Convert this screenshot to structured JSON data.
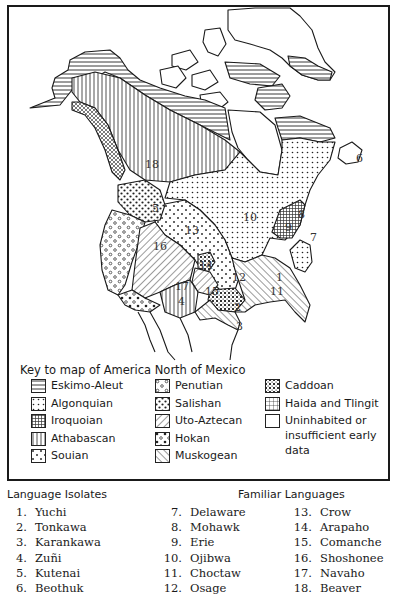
{
  "map": {
    "region_labels": [
      {
        "id": "18",
        "x": 145,
        "y": 168
      },
      {
        "id": "6",
        "x": 356,
        "y": 162
      },
      {
        "id": "5",
        "x": 152,
        "y": 212
      },
      {
        "id": "10",
        "x": 243,
        "y": 221
      },
      {
        "id": "8",
        "x": 298,
        "y": 218
      },
      {
        "id": "9",
        "x": 285,
        "y": 231
      },
      {
        "id": "7",
        "x": 310,
        "y": 241
      },
      {
        "id": "13",
        "x": 185,
        "y": 234
      },
      {
        "id": "16",
        "x": 153,
        "y": 250
      },
      {
        "id": "14",
        "x": 199,
        "y": 269
      },
      {
        "id": "12",
        "x": 232,
        "y": 281
      },
      {
        "id": "1",
        "x": 276,
        "y": 281
      },
      {
        "id": "11",
        "x": 270,
        "y": 295
      },
      {
        "id": "17",
        "x": 175,
        "y": 290
      },
      {
        "id": "15",
        "x": 205,
        "y": 295
      },
      {
        "id": "4",
        "x": 178,
        "y": 305
      },
      {
        "id": "2",
        "x": 234,
        "y": 311
      },
      {
        "id": "3",
        "x": 236,
        "y": 330
      }
    ]
  },
  "legend": {
    "title": "Key to map of America North of Mexico",
    "columns": [
      [
        {
          "pattern": "eskimo",
          "label": "Eskimo-Aleut"
        },
        {
          "pattern": "algonquian",
          "label": "Algonquian"
        },
        {
          "pattern": "iroquoian",
          "label": "Iroquoian"
        },
        {
          "pattern": "athabascan",
          "label": "Athabascan"
        },
        {
          "pattern": "souian",
          "label": "Souian"
        }
      ],
      [
        {
          "pattern": "penutian",
          "label": "Penutian"
        },
        {
          "pattern": "salishan",
          "label": "Salishan"
        },
        {
          "pattern": "uto",
          "label": "Uto-Aztecan"
        },
        {
          "pattern": "hokan",
          "label": "Hokan"
        },
        {
          "pattern": "muskogean",
          "label": "Muskogean"
        }
      ],
      [
        {
          "pattern": "caddoan",
          "label": "Caddoan"
        },
        {
          "pattern": "haida",
          "label": "Haida and Tlingit"
        },
        {
          "pattern": "blank",
          "label": "Uninhabited or insufficient early data"
        }
      ]
    ]
  },
  "isolates": {
    "title": "Language Isolates",
    "items": [
      {
        "num": "1.",
        "name": "Yuchi"
      },
      {
        "num": "2.",
        "name": "Tonkawa"
      },
      {
        "num": "3.",
        "name": "Karankawa"
      },
      {
        "num": "4.",
        "name": "Zuñi"
      },
      {
        "num": "5.",
        "name": "Kutenai"
      },
      {
        "num": "6.",
        "name": "Beothuk"
      }
    ]
  },
  "familiar": {
    "title": "Familiar Languages",
    "col1": [
      {
        "num": "7.",
        "name": "Delaware"
      },
      {
        "num": "8.",
        "name": "Mohawk"
      },
      {
        "num": "9.",
        "name": "Erie"
      },
      {
        "num": "10.",
        "name": "Ojibwa"
      },
      {
        "num": "11.",
        "name": "Choctaw"
      },
      {
        "num": "12.",
        "name": "Osage"
      }
    ],
    "col2": [
      {
        "num": "13.",
        "name": "Crow"
      },
      {
        "num": "14.",
        "name": "Arapaho"
      },
      {
        "num": "15.",
        "name": "Comanche"
      },
      {
        "num": "16.",
        "name": "Shoshonee"
      },
      {
        "num": "17.",
        "name": "Navaho"
      },
      {
        "num": "18.",
        "name": "Beaver"
      }
    ]
  }
}
